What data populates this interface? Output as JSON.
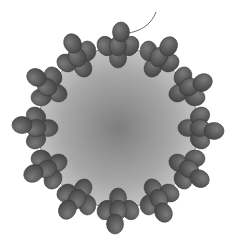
{
  "figure": {
    "width": 232,
    "height": 239,
    "background": "#ffffff",
    "cell": {
      "cx": 118,
      "cy": 128,
      "r": 80,
      "edge_color": "#8a8a8a",
      "center_color": "#7e7e7e",
      "rim_color": "#bdbdbd"
    },
    "tail": {
      "path": "M121 34 C 135 33, 150 28, 156 12",
      "color": "#6a6a6a"
    },
    "bead": {
      "rx": 8.5,
      "ry": 10,
      "fill_light": "#7a7a7a",
      "fill_dark": "#4a4a4a",
      "stroke": "#3a3a3a"
    },
    "clusters": {
      "count": 12,
      "angles_deg": [
        -90,
        -60,
        -30,
        0,
        30,
        60,
        90,
        120,
        150,
        180,
        210,
        240
      ],
      "inner_radius": 70,
      "mid_radius": 82,
      "outer_radius": 96,
      "side_offset": 12
    }
  }
}
